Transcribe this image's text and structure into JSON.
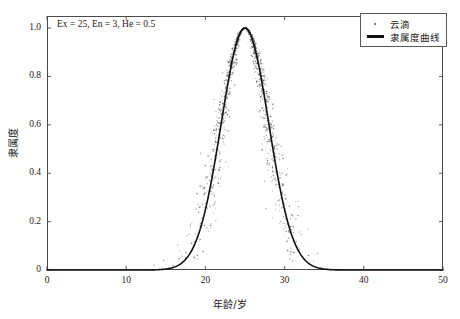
{
  "top_caption": "",
  "annotation": "Ex = 25, En = 3, He = 0.5",
  "legend": {
    "items": [
      {
        "label": "云滴",
        "marker": "dot-marker-icon"
      },
      {
        "label": "隶属度曲线",
        "marker": "line-marker-icon"
      }
    ]
  },
  "chart_data": {
    "type": "scatter",
    "title": "",
    "xlabel": "年龄/岁",
    "ylabel": "隶属度",
    "xlim": [
      0,
      50
    ],
    "ylim": [
      0,
      1.05
    ],
    "xticks": [
      0,
      10,
      20,
      30,
      40,
      50
    ],
    "xtick_labels": [
      "0",
      "10",
      "20",
      "30",
      "40",
      "50"
    ],
    "yticks": [
      0,
      0.2,
      0.4,
      0.6,
      0.8,
      1.0
    ],
    "ytick_labels": [
      "0",
      "0.2",
      "0.4",
      "0.6",
      "0.8",
      "1.0"
    ],
    "grid": false,
    "legend_position": "top-right",
    "model": "normal-cloud",
    "parameters": {
      "Ex": 25,
      "En": 3,
      "He": 0.5
    },
    "n_points": 1200,
    "series": [
      {
        "name": "云滴",
        "type": "scatter",
        "color": "#6b6b6b",
        "marker_size": 0.9,
        "description": "Cloud drops scattered about the membership curve; spread widens away from the peak due to hyper-entropy He = 0.5"
      },
      {
        "name": "隶属度曲线",
        "type": "line",
        "color": "#111111",
        "linewidth": 1.6,
        "formula": "y = exp(-(x - 25)^2 / (2 * 3^2))",
        "curve_points": {
          "x": [
            12,
            13,
            14,
            15,
            16,
            17,
            18,
            19,
            20,
            21,
            22,
            23,
            24,
            25,
            26,
            27,
            28,
            29,
            30,
            31,
            32,
            33,
            34,
            35,
            36,
            37,
            38
          ],
          "y": [
            0.0,
            0.001,
            0.003,
            0.011,
            0.032,
            0.084,
            0.189,
            0.359,
            0.577,
            0.779,
            0.93,
            0.995,
            1.0,
            1.0,
            1.0,
            0.995,
            0.93,
            0.779,
            0.577,
            0.359,
            0.189,
            0.084,
            0.032,
            0.011,
            0.003,
            0.001,
            0.0
          ]
        }
      }
    ]
  }
}
